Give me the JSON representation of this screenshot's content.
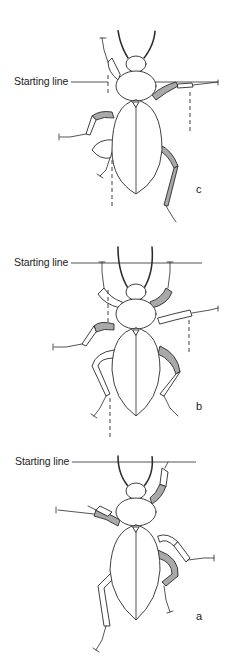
{
  "figure": {
    "panels": [
      {
        "id": "c",
        "letter": "c",
        "starting_line_label": "Starting line",
        "top": 0
      },
      {
        "id": "b",
        "letter": "b",
        "starting_line_label": "Starting line",
        "top": 220
      },
      {
        "id": "a",
        "letter": "a",
        "starting_line_label": "Starting line",
        "top": 440
      }
    ],
    "colors": {
      "line": "#2a2a2a",
      "shading": "#a9a9a9",
      "background": "#ffffff"
    }
  }
}
